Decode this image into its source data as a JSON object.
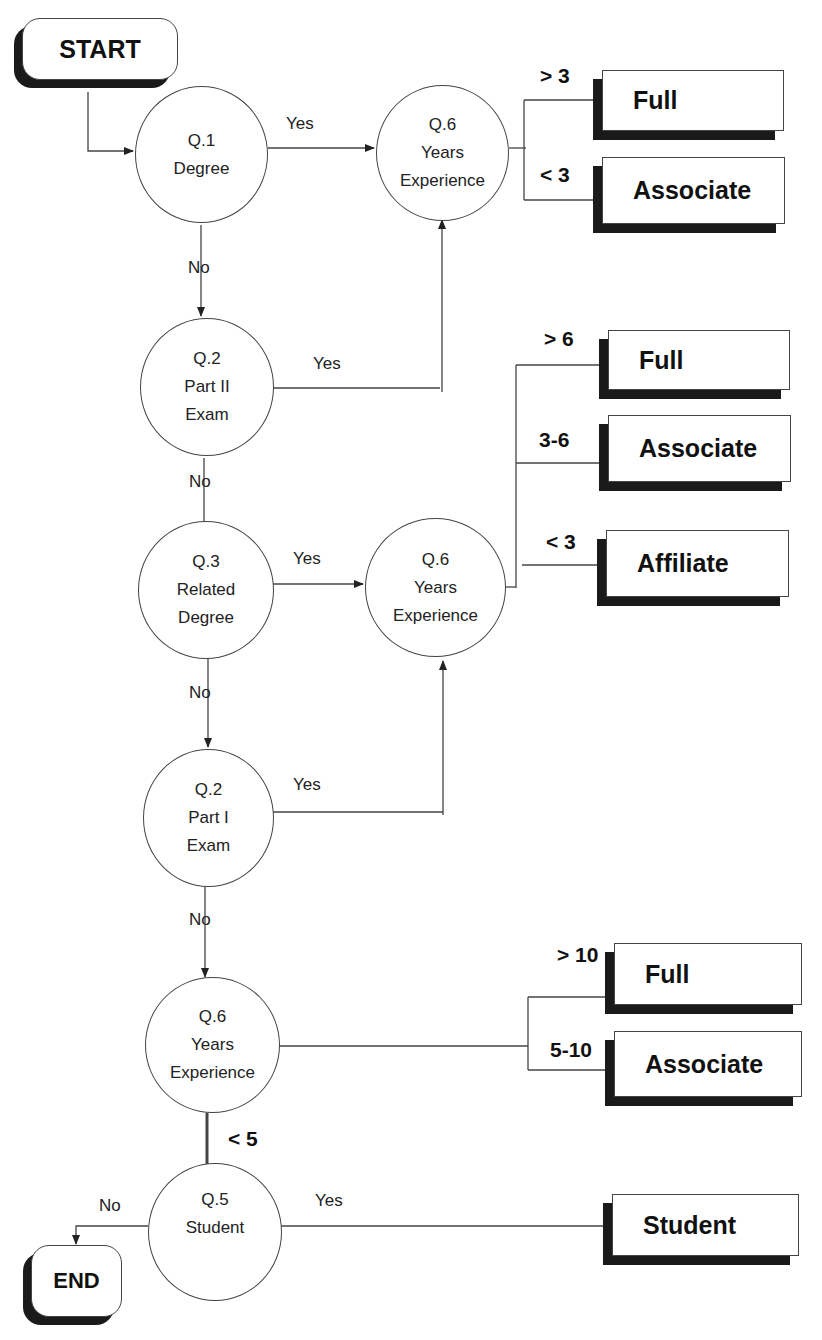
{
  "diagram": {
    "type": "flowchart",
    "terminals": {
      "start": "START",
      "end": "END"
    },
    "nodes": {
      "q1": {
        "id": "Q.1",
        "text": "Degree"
      },
      "q6a": {
        "id": "Q.6",
        "line1": "Years",
        "line2": "Experience"
      },
      "q2a": {
        "id": "Q.2",
        "line1": "Part II",
        "line2": "Exam"
      },
      "q3": {
        "id": "Q.3",
        "line1": "Related",
        "line2": "Degree"
      },
      "q6b": {
        "id": "Q.6",
        "line1": "Years",
        "line2": "Experience"
      },
      "q2b": {
        "id": "Q.2",
        "line1": "Part I",
        "line2": "Exam"
      },
      "q6c": {
        "id": "Q.6",
        "line1": "Years",
        "line2": "Experience"
      },
      "q5": {
        "id": "Q.5",
        "text": "Student"
      }
    },
    "edge_labels": {
      "q1_yes": "Yes",
      "q1_no": "No",
      "q2a_yes": "Yes",
      "q2a_no": "No",
      "q3_yes": "Yes",
      "q3_no": "No",
      "q2b_yes": "Yes",
      "q2b_no": "No",
      "q6c_lt5": "< 5",
      "q5_no": "No",
      "q5_yes": "Yes"
    },
    "outcomes_group1": [
      {
        "condition": "> 3",
        "label": "Full"
      },
      {
        "condition": "< 3",
        "label": "Associate"
      }
    ],
    "outcomes_group2": [
      {
        "condition": "> 6",
        "label": "Full"
      },
      {
        "condition": "3-6",
        "label": "Associate"
      },
      {
        "condition": "< 3",
        "label": "Affiliate"
      }
    ],
    "outcomes_group3": [
      {
        "condition": "> 10",
        "label": "Full"
      },
      {
        "condition": "5-10",
        "label": "Associate"
      }
    ],
    "outcome_student": {
      "label": "Student"
    }
  }
}
